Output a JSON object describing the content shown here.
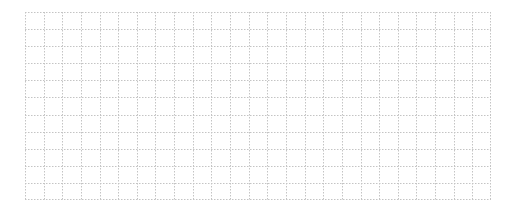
{
  "grid": {
    "columns": 25,
    "rows": 11,
    "line_color": "#c4c4c4",
    "line_style": "dotted",
    "background": "#ffffff"
  }
}
